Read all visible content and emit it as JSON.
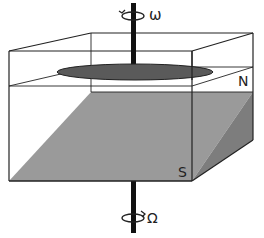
{
  "diagram": {
    "type": "rotating-tank-schematic",
    "labels": {
      "top_rotation": "ω",
      "bottom_rotation": "Ω",
      "north": "N",
      "south": "S"
    },
    "colors": {
      "outline": "#222222",
      "slope_face": "#9a9a9a",
      "slope_side": "#7d7d7d",
      "disk": "#5a5a5a",
      "shaft": "#111111",
      "background": "#ffffff"
    }
  }
}
